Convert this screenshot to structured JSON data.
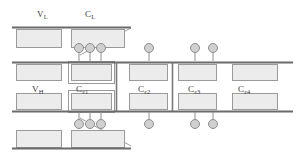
{
  "figure": {
    "type": "schematic-cross-section",
    "width": 300,
    "height": 158,
    "background_color": "#ffffff"
  },
  "colors": {
    "rail": "#6b6b6b",
    "block_fill": "#ececec",
    "block_stroke": "#9a9a9a",
    "contact_fill": "#d0d0d0",
    "contact_stroke": "#8e8e8e",
    "stem": "#8e8e8e",
    "divider": "#7a7a7a",
    "diagonal": "#a0a0a0",
    "text": "#3c3c3c"
  },
  "labels": {
    "v_low": {
      "base": "V",
      "sub": "L",
      "x": 37,
      "y": 10
    },
    "c_low": {
      "base": "C",
      "sub": "L",
      "x": 85,
      "y": 10
    },
    "v_high": {
      "base": "V",
      "sub": "H",
      "x": 32,
      "y": 85
    },
    "cell1": {
      "base": "C",
      "sub": "ε1",
      "x": 76,
      "y": 85
    },
    "cell2": {
      "base": "C",
      "sub": "ε2",
      "x": 138,
      "y": 85
    },
    "cell3": {
      "base": "C",
      "sub": "ε3",
      "x": 188,
      "y": 85
    },
    "cell4": {
      "base": "C",
      "sub": "ε4",
      "x": 238,
      "y": 85
    }
  },
  "rails": [
    {
      "name": "top-rail",
      "x1": 12,
      "x2": 131,
      "y": 27
    },
    {
      "name": "upper-mid-rail",
      "x1": 12,
      "x2": 293,
      "y": 62
    },
    {
      "name": "lower-mid-rail",
      "x1": 12,
      "x2": 293,
      "y": 111
    },
    {
      "name": "bottom-rail",
      "x1": 12,
      "x2": 131,
      "y": 148
    }
  ],
  "dividers": [
    {
      "name": "divider-left",
      "x": 116,
      "y1": 62,
      "y2": 111
    },
    {
      "name": "divider-right",
      "x": 172,
      "y1": 62,
      "y2": 111
    }
  ],
  "diagonals": [
    {
      "name": "diagonal-top",
      "x1": 80,
      "y1": 55,
      "x2": 131,
      "y2": 28
    },
    {
      "name": "diagonal-bottom",
      "x1": 80,
      "y1": 118,
      "x2": 131,
      "y2": 146
    }
  ],
  "blocks": [
    {
      "name": "block-top-vl",
      "x": 16,
      "y": 29,
      "w": 45,
      "h": 18,
      "double": false
    },
    {
      "name": "block-top-cl",
      "x": 71,
      "y": 29,
      "w": 53,
      "h": 18,
      "double": false
    },
    {
      "name": "block-upper-vh",
      "x": 16,
      "y": 64,
      "w": 45,
      "h": 16,
      "double": false
    },
    {
      "name": "block-upper-ce1",
      "x": 71,
      "y": 64,
      "w": 40,
      "h": 16,
      "double": true
    },
    {
      "name": "block-upper-ce2",
      "x": 129,
      "y": 64,
      "w": 38,
      "h": 16,
      "double": false
    },
    {
      "name": "block-upper-ce3",
      "x": 178,
      "y": 64,
      "w": 38,
      "h": 16,
      "double": false
    },
    {
      "name": "block-upper-ce4",
      "x": 232,
      "y": 64,
      "w": 45,
      "h": 16,
      "double": false
    },
    {
      "name": "block-lower-vh",
      "x": 16,
      "y": 93,
      "w": 45,
      "h": 16,
      "double": false
    },
    {
      "name": "block-lower-ce1",
      "x": 71,
      "y": 93,
      "w": 40,
      "h": 16,
      "double": true
    },
    {
      "name": "block-lower-ce2",
      "x": 129,
      "y": 93,
      "w": 38,
      "h": 16,
      "double": false
    },
    {
      "name": "block-lower-ce3",
      "x": 178,
      "y": 93,
      "w": 38,
      "h": 16,
      "double": false
    },
    {
      "name": "block-lower-ce4",
      "x": 232,
      "y": 93,
      "w": 45,
      "h": 16,
      "double": false
    },
    {
      "name": "block-bottom-vl",
      "x": 16,
      "y": 130,
      "w": 45,
      "h": 17,
      "double": false
    },
    {
      "name": "block-bottom-cl",
      "x": 71,
      "y": 130,
      "w": 53,
      "h": 17,
      "double": false
    }
  ],
  "contacts": [
    {
      "name": "contact-upper-1",
      "cx": 79,
      "cy": 48,
      "r": 4.5,
      "stem_to": 61
    },
    {
      "name": "contact-upper-2",
      "cx": 90,
      "cy": 48,
      "r": 4.5,
      "stem_to": 61
    },
    {
      "name": "contact-upper-3",
      "cx": 101,
      "cy": 48,
      "r": 4.5,
      "stem_to": 61
    },
    {
      "name": "contact-upper-4",
      "cx": 149,
      "cy": 48,
      "r": 4.5,
      "stem_to": 61
    },
    {
      "name": "contact-upper-5",
      "cx": 195,
      "cy": 48,
      "r": 4.5,
      "stem_to": 61
    },
    {
      "name": "contact-upper-6",
      "cx": 213,
      "cy": 48,
      "r": 4.5,
      "stem_to": 61
    },
    {
      "name": "contact-lower-1",
      "cx": 79,
      "cy": 124,
      "r": 4.5,
      "stem_to": 112
    },
    {
      "name": "contact-lower-2",
      "cx": 90,
      "cy": 124,
      "r": 4.5,
      "stem_to": 112
    },
    {
      "name": "contact-lower-3",
      "cx": 101,
      "cy": 124,
      "r": 4.5,
      "stem_to": 112
    },
    {
      "name": "contact-lower-4",
      "cx": 149,
      "cy": 124,
      "r": 4.5,
      "stem_to": 112
    },
    {
      "name": "contact-lower-5",
      "cx": 195,
      "cy": 124,
      "r": 4.5,
      "stem_to": 112
    },
    {
      "name": "contact-lower-6",
      "cx": 213,
      "cy": 124,
      "r": 4.5,
      "stem_to": 112
    }
  ]
}
